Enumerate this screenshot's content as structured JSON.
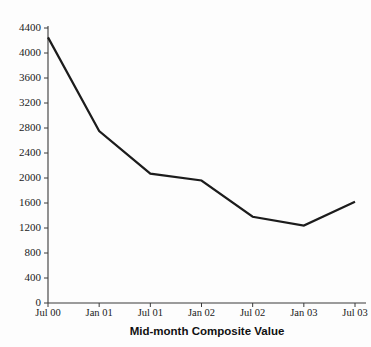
{
  "chart_data": {
    "type": "line",
    "title": "",
    "xlabel": "Mid-month Composite Value",
    "ylabel": "",
    "categories": [
      "Jul 00",
      "Jan 01",
      "Jul 01",
      "Jan 02",
      "Jul 02",
      "Jan 03",
      "Jul 03"
    ],
    "values": [
      4250,
      2750,
      2070,
      1960,
      1380,
      1240,
      1620
    ],
    "series": [
      {
        "name": "Composite Value",
        "values": [
          4250,
          2750,
          2070,
          1960,
          1380,
          1240,
          1620
        ]
      }
    ],
    "ylim": [
      0,
      4400
    ],
    "ytick_step": 400,
    "ytick_labels": [
      "0",
      "400",
      "800",
      "1200",
      "1600",
      "2000",
      "2400",
      "2800",
      "3200",
      "3600",
      "4000",
      "4400"
    ],
    "ytick_values": [
      0,
      400,
      800,
      1200,
      1600,
      2000,
      2400,
      2800,
      3200,
      3600,
      4000,
      4400
    ],
    "xtick_labels": [
      "Jul 00",
      "Jan 01",
      "Jul 01",
      "Jan 02",
      "Jul 02",
      "Jan 03",
      "Jul 03"
    ],
    "grid": false,
    "legend": false,
    "legend_position": "none",
    "line_color": "#1c1c1c",
    "axis_color": "#3a3a3a",
    "background_color": "#fdfdfd"
  }
}
